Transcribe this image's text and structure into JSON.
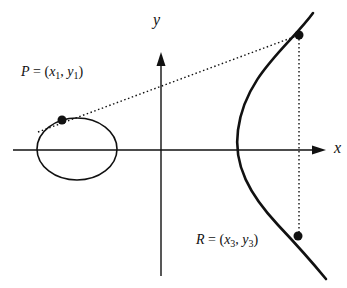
{
  "diagram": {
    "axes": {
      "x_label": "x",
      "y_label": "y"
    },
    "points": {
      "P": {
        "name": "P",
        "eq": " = (",
        "x": "x",
        "x_sub": "1",
        "sep": ", ",
        "y": "y",
        "y_sub": "1",
        "close": ")"
      },
      "R": {
        "name": "R",
        "eq": " = (",
        "x": "x",
        "x_sub": "3",
        "sep": ", ",
        "y": "y",
        "y_sub": "3",
        "close": ")"
      }
    },
    "colors": {
      "stroke": "#111111",
      "background": "#ffffff"
    }
  }
}
